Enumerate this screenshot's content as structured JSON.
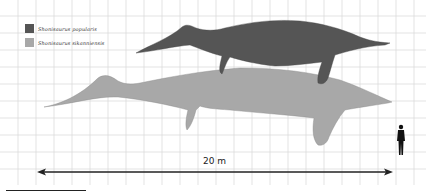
{
  "legend": {
    "items": [
      {
        "label": "Shonisaurus popularis",
        "color": "#555555"
      },
      {
        "label": "Shonisaurus sikanniensis",
        "color": "#a8a8a8"
      }
    ]
  },
  "scale": {
    "label": "20 m",
    "arrow_color": "#222222"
  },
  "grid": {
    "line_color": "#d9d9d9",
    "spacing_x": 18,
    "spacing_y": 17
  },
  "figures": {
    "small_species_color": "#555555",
    "large_species_color": "#a8a8a8",
    "human_color": "#111111"
  }
}
